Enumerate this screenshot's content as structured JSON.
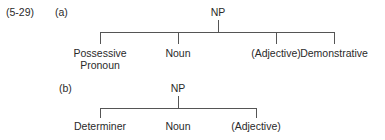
{
  "example_number": "(5-29)",
  "trees": [
    {
      "label": "(a)",
      "root": "NP",
      "children": [
        "Possessive Pronoun",
        "Noun",
        "(Adjective)",
        "Demonstrative"
      ],
      "children_lines": [
        [
          "Possessive",
          "Pronoun"
        ],
        [
          "Noun"
        ],
        [
          "(Adjective)"
        ],
        [
          "Demonstrative"
        ]
      ]
    },
    {
      "label": "(b)",
      "root": "NP",
      "children": [
        "Determiner",
        "Noun",
        "(Adjective)"
      ]
    }
  ]
}
